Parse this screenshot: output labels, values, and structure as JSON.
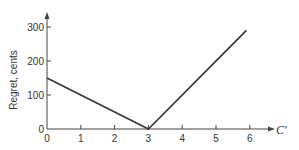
{
  "chart_data": {
    "type": "line",
    "title": "",
    "xlabel": "C'",
    "ylabel": "Regret, cents",
    "x_ticks": [
      0,
      1,
      2,
      3,
      4,
      5,
      6
    ],
    "y_ticks": [
      0,
      100,
      200,
      300
    ],
    "xlim": [
      0,
      6.6
    ],
    "ylim": [
      0,
      350
    ],
    "grid": false,
    "legend": null,
    "series": [
      {
        "name": "Regret",
        "x": [
          0,
          3,
          5.9
        ],
        "y": [
          150,
          0,
          290
        ]
      }
    ],
    "colors": {
      "line": "#333333",
      "axis": "#444444",
      "text": "#333333"
    }
  }
}
